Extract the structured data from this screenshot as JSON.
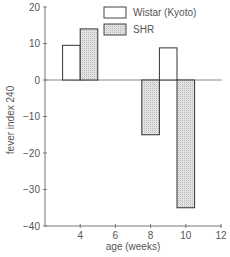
{
  "chart_data": {
    "type": "bar",
    "title": "",
    "xlabel": "age (weeks)",
    "ylabel": "fever index 240",
    "xlim": [
      2,
      12
    ],
    "ylim": [
      -40,
      20
    ],
    "xticks": [
      4,
      6,
      8,
      10,
      12
    ],
    "yticks": [
      20,
      10,
      0,
      -10,
      -20,
      -30,
      -40
    ],
    "ytick_labels": [
      "20",
      "10",
      "0",
      "−10",
      "−20",
      "−30",
      "−40"
    ],
    "grid": false,
    "legend_position": "top-right",
    "series": [
      {
        "name": "Wistar (Kyoto)",
        "fill": "#ffffff",
        "bars": [
          {
            "x0": 3.0,
            "x1": 4.0,
            "value": 9.5
          },
          {
            "x0": 8.5,
            "x1": 9.5,
            "value": 8.8
          }
        ]
      },
      {
        "name": "SHR",
        "fill": "#d9d9d9",
        "bars": [
          {
            "x0": 4.0,
            "x1": 5.0,
            "value": 14
          },
          {
            "x0": 7.5,
            "x1": 8.5,
            "value": -15
          },
          {
            "x0": 9.5,
            "x1": 10.5,
            "value": -35
          }
        ]
      }
    ]
  },
  "legend": {
    "wistar_label": "Wistar (Kyoto)",
    "shr_label": "SHR"
  },
  "axes": {
    "xlabel": "age (weeks)",
    "ylabel": "fever index 240"
  }
}
